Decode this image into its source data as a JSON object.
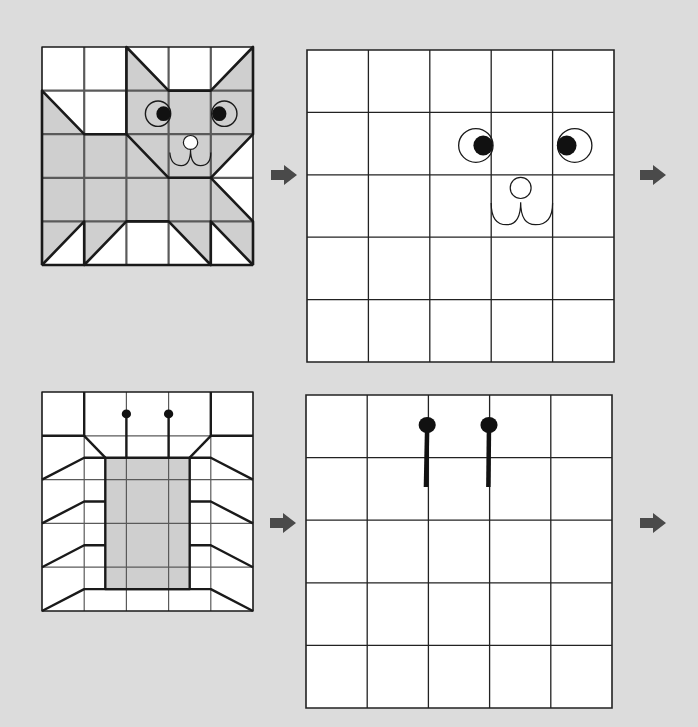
{
  "page": {
    "background": "#dcdcdc",
    "grid_line_color": "#333333",
    "shape_stroke_color": "#1a1a1a",
    "fill_color": "#cfcfcf",
    "arrow_color": "#4a4a4a"
  },
  "puzzles": [
    {
      "name": "cat",
      "reference_grid": {
        "rows": 5,
        "cols": 5,
        "x": 42,
        "y": 47,
        "width": 211,
        "height": 218
      },
      "drawing_grid": {
        "rows": 5,
        "cols": 5,
        "x": 307,
        "y": 50,
        "width": 307,
        "height": 312
      },
      "arrows": [
        {
          "x": 271,
          "y": 165
        },
        {
          "x": 640,
          "y": 165
        }
      ]
    },
    {
      "name": "bug",
      "reference_grid": {
        "rows": 5,
        "cols": 5,
        "x": 42,
        "y": 392,
        "width": 211,
        "height": 219
      },
      "drawing_grid": {
        "rows": 5,
        "cols": 5,
        "x": 306,
        "y": 395,
        "width": 306,
        "height": 313
      },
      "arrows": [
        {
          "x": 270,
          "y": 513
        },
        {
          "x": 640,
          "y": 513
        }
      ]
    }
  ]
}
